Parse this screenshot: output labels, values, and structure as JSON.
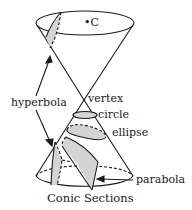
{
  "title": "Conic Sections",
  "labels": {
    "center": "•C",
    "hyperbola": "hyperbola",
    "vertex": "vertex",
    "circle": "circle",
    "ellipse": "ellipse",
    "parabola": "parabola"
  },
  "colors": {
    "line": "#1a1a1a",
    "shade": "#d4d4d4",
    "background": "#ffffff"
  }
}
